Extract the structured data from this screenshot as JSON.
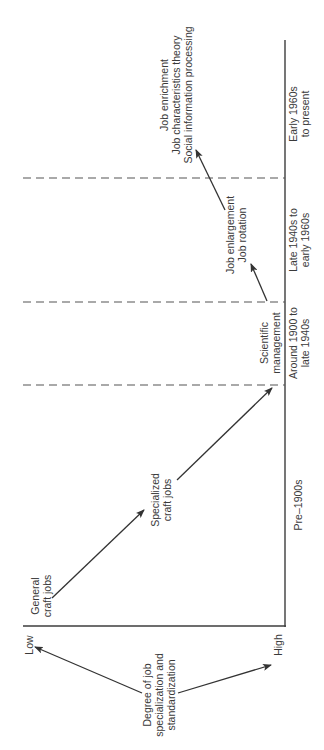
{
  "diagram": {
    "orientation": "rotated-90-ccw",
    "colors": {
      "line": "#3d3d3d",
      "text": "#3a3a3a",
      "background": "#ffffff"
    },
    "y_axis": {
      "title_line1": "Degree of job",
      "title_line2": "specialization and",
      "title_line3": "standardization",
      "low_label": "Low",
      "high_label": "High"
    },
    "periods": [
      {
        "line1": "Pre–1900s",
        "line2": ""
      },
      {
        "line1": "Around 1900 to",
        "line2": "late 1940s"
      },
      {
        "line1": "Late 1940s to",
        "line2": "early 1960s"
      },
      {
        "line1": "Early 1960s",
        "line2": "to present"
      }
    ],
    "stages": [
      {
        "lines": [
          "General",
          "craft jobs"
        ]
      },
      {
        "lines": [
          "Specialized",
          "craft jobs"
        ]
      },
      {
        "lines": [
          "Scientific",
          "management"
        ]
      },
      {
        "lines": [
          "Job enlargement",
          "Job rotation"
        ]
      },
      {
        "lines": [
          "Job enrichment",
          "Job characteristics theory",
          "Social information processing"
        ]
      }
    ]
  }
}
